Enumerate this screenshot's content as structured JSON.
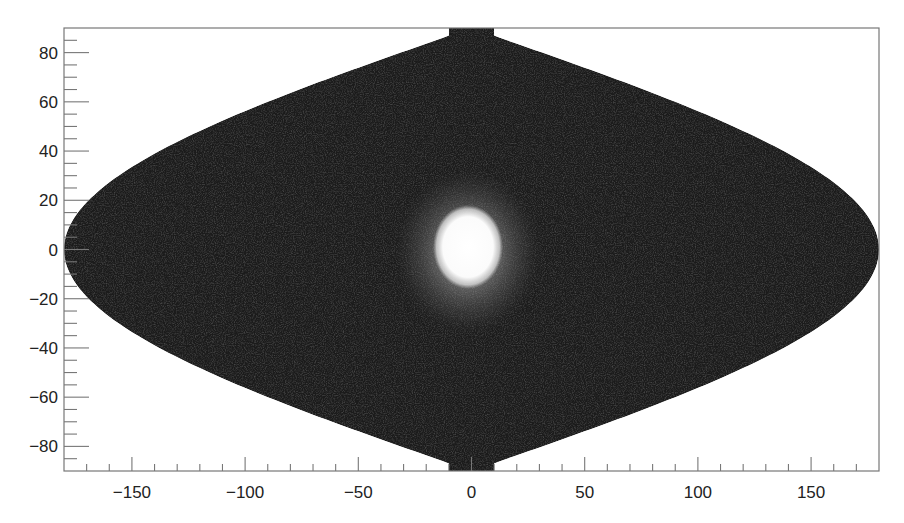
{
  "chart_data": {
    "type": "heatmap",
    "projection": "sinusoidal (equal-area) sky map",
    "title": "",
    "xlabel": "",
    "ylabel": "",
    "xlim": [
      -180,
      180
    ],
    "ylim": [
      -90,
      90
    ],
    "x_ticks": [
      -150,
      -100,
      -50,
      0,
      50,
      100,
      150
    ],
    "x_tick_labels": [
      "−150",
      "−100",
      "−50",
      "0",
      "50",
      "100",
      "150"
    ],
    "y_ticks": [
      80,
      60,
      40,
      20,
      0,
      -20,
      -40,
      -60,
      -80
    ],
    "y_tick_labels": [
      "80",
      "60",
      "40",
      "20",
      "0",
      "−20",
      "−40",
      "−60",
      "−80"
    ],
    "x_minor_step": 10,
    "y_minor_step": 5,
    "grid": false,
    "legend": null,
    "colormap": "grayscale (black low, white high)",
    "background_level": "low, noisy dark gray (~#1a1a1a)",
    "features": [
      {
        "name": "bright central source",
        "center": [
          0,
          0
        ],
        "extent_x": [
          -12,
          12
        ],
        "extent_y": [
          -12,
          15
        ],
        "intensity": "saturated white"
      },
      {
        "name": "diffuse halo",
        "center": [
          0,
          0
        ],
        "radius_approx": 30,
        "intensity": "gray gradient"
      }
    ]
  },
  "colors": {
    "background": "#ffffff",
    "axis": "#666666",
    "map_fill": "#1b1b1b",
    "peak": "#ffffff"
  }
}
